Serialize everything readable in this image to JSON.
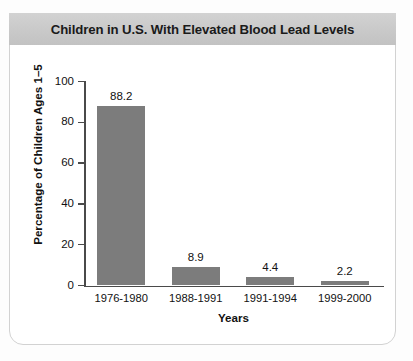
{
  "chart_data": {
    "type": "bar",
    "title": "Children in U.S. With Elevated Blood Lead Levels",
    "xlabel": "Years",
    "ylabel": "Percentage of Children Ages 1–5",
    "categories": [
      "1976-1980",
      "1988-1991",
      "1991-1994",
      "1999-2000"
    ],
    "values": [
      88.2,
      8.9,
      4.4,
      2.2
    ],
    "value_labels": [
      "88.2",
      "8.9",
      "4.4",
      "2.2"
    ],
    "ylim": [
      0,
      100
    ],
    "yticks": [
      0,
      20,
      40,
      60,
      80,
      100
    ],
    "ytick_labels": [
      "0",
      "20",
      "40",
      "60",
      "80",
      "100"
    ],
    "grid": false,
    "legend": false,
    "bar_color": "#7c7c7c",
    "title_band_color": "#c9c9c9",
    "axis_color": "#4a4a4a",
    "card_background": "#ffffff"
  }
}
